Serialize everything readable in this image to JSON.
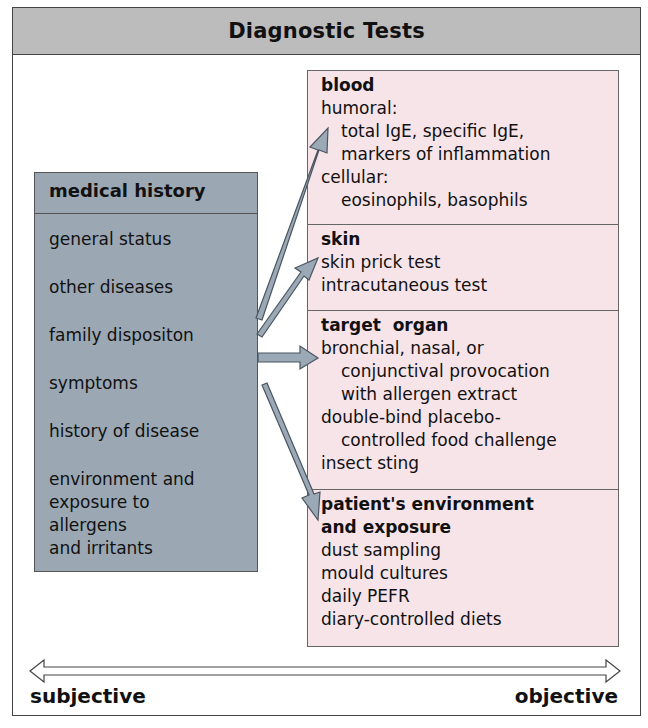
{
  "title": "Diagnostic Tests",
  "medical_history": {
    "header": "medical history",
    "items": [
      "general status",
      "other diseases",
      "family dispositon",
      "symptoms",
      "history of disease",
      "environment and exposure to allergens and irritants"
    ],
    "last_item_lines": [
      "environment and",
      "exposure to",
      "allergens",
      "and irritants"
    ]
  },
  "tests": {
    "blood": {
      "title": "blood",
      "lines": [
        {
          "text": "humoral:",
          "indent": false
        },
        {
          "text": "total IgE, specific IgE,",
          "indent": true
        },
        {
          "text": "markers of inflammation",
          "indent": true
        },
        {
          "text": "cellular:",
          "indent": false
        },
        {
          "text": "eosinophils, basophils",
          "indent": true
        }
      ]
    },
    "skin": {
      "title": "skin",
      "lines": [
        {
          "text": "skin prick test",
          "indent": false
        },
        {
          "text": "intracutaneous test",
          "indent": false
        }
      ]
    },
    "target_organ": {
      "title": "target  organ",
      "lines": [
        {
          "text": "bronchial, nasal, or",
          "indent": false
        },
        {
          "text": "conjunctival provocation",
          "indent": true
        },
        {
          "text": "with allergen extract",
          "indent": true
        },
        {
          "text": "double-bind placebo-",
          "indent": false
        },
        {
          "text": "controlled food challenge",
          "indent": true
        },
        {
          "text": "insect sting",
          "indent": false
        }
      ]
    },
    "environment": {
      "title_line1": "patient's environment",
      "title_line2": "and exposure",
      "lines": [
        {
          "text": "dust sampling",
          "indent": false
        },
        {
          "text": "mould cultures",
          "indent": false
        },
        {
          "text": "daily PEFR",
          "indent": false
        },
        {
          "text": "diary-controlled diets",
          "indent": false
        }
      ]
    }
  },
  "scale": {
    "left_label": "subjective",
    "right_label": "objective"
  },
  "colors": {
    "title_band": "#bcbcbc",
    "history_box": "#9ba8b4",
    "tests_box": "#f7e4e9",
    "arrow_fill": "#9aa9b5",
    "border": "#444444"
  }
}
